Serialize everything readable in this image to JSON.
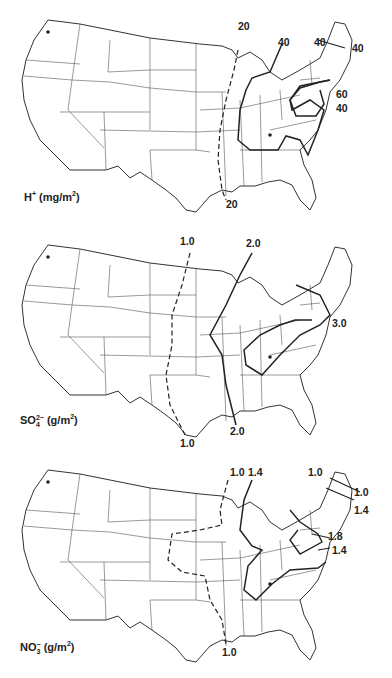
{
  "figure": {
    "type": "isopleth maps of wet deposition over contiguous United States",
    "maps": [
      {
        "id": "h_plus",
        "species_label": "H",
        "species_sup": "+",
        "units": "(mg/m",
        "units_sup": "2",
        "units_close": ")",
        "contours": [
          {
            "value": "20",
            "style": "dashed"
          },
          {
            "value": "20",
            "style": "dashed"
          },
          {
            "value": "40",
            "style": "solid"
          },
          {
            "value": "40",
            "style": "solid"
          },
          {
            "value": "40",
            "style": "solid"
          },
          {
            "value": "60",
            "style": "solid"
          },
          {
            "value": "40",
            "style": "solid"
          }
        ]
      },
      {
        "id": "so4",
        "species_label": "SO",
        "species_sub": "4",
        "species_sup": "2−",
        "units": "(g/m",
        "units_sup": "2",
        "units_close": ")",
        "contours": [
          {
            "value": "1.0",
            "style": "dashed"
          },
          {
            "value": "1.0",
            "style": "dashed"
          },
          {
            "value": "2.0",
            "style": "solid"
          },
          {
            "value": "2.0",
            "style": "solid"
          },
          {
            "value": "3.0",
            "style": "solid"
          }
        ]
      },
      {
        "id": "no3",
        "species_label": "NO",
        "species_sub": "3",
        "species_sup": "−",
        "units": "(g/m",
        "units_sup": "2",
        "units_close": ")",
        "contours": [
          {
            "value": "1.0",
            "style": "dashed"
          },
          {
            "value": "1.4",
            "style": "solid"
          },
          {
            "value": "1.0",
            "style": "solid"
          },
          {
            "value": "1.0",
            "style": "solid"
          },
          {
            "value": "1.4",
            "style": "solid"
          },
          {
            "value": "1.8",
            "style": "solid"
          },
          {
            "value": "1.4",
            "style": "solid"
          },
          {
            "value": "1.0",
            "style": "dashed"
          }
        ]
      }
    ]
  }
}
